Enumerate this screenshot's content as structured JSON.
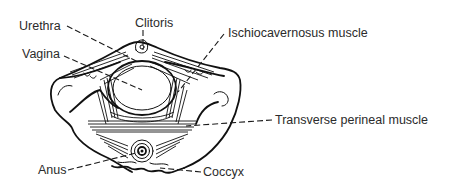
{
  "figure": {
    "labels": [
      {
        "id": "urethra",
        "text": "Urethra"
      },
      {
        "id": "clitoris",
        "text": "Clitoris"
      },
      {
        "id": "vagina",
        "text": "Vagina"
      },
      {
        "id": "ischiocavernosus",
        "text": "Ischiocavernosus muscle"
      },
      {
        "id": "transverse",
        "text": "Transverse perineal muscle"
      },
      {
        "id": "anus",
        "text": "Anus"
      },
      {
        "id": "coccyx",
        "text": "Coccyx"
      }
    ],
    "colors": {
      "background": "#ffffff",
      "ink": "#111111",
      "label_text": "#2b2b2b"
    }
  }
}
